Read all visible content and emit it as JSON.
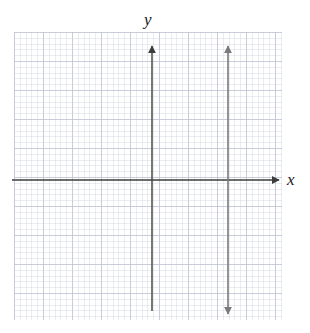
{
  "figure": {
    "width": 310,
    "height": 333,
    "background_color": "#ffffff"
  },
  "grid": {
    "name": "graph-paper-grid",
    "left": 14,
    "top": 32,
    "width": 268,
    "height": 288,
    "major_spacing_px": 29,
    "minor_spacing_px": 5.8,
    "major_color": "#7884a0",
    "minor_color": "#96a0b9",
    "visible": true
  },
  "axes": {
    "x_axis": {
      "label": "x",
      "name": "x-axis",
      "color": "#3c3c3c",
      "y_px": 180,
      "start_x_px": 12,
      "end_x_px": 284,
      "arrow": "right",
      "label_x_px": 287,
      "label_y_px": 171
    },
    "y_axis": {
      "label": "y",
      "name": "y-axis",
      "color": "#4a4a4a",
      "x_px": 152,
      "start_y_px": 41,
      "end_y_px": 311,
      "arrow": "up",
      "label_x_px": 144,
      "label_y_px": 11
    },
    "origin": {
      "x_px": 152,
      "y_px": 180
    }
  },
  "chart_data": {
    "type": "line",
    "title": "",
    "xlabel": "x",
    "ylabel": "y",
    "grid": true,
    "legend": "none",
    "xlim": [
      -4.8,
      4.6
    ],
    "ylim": [
      -4.8,
      5.1
    ],
    "series": [
      {
        "name": "vertical-line",
        "kind": "vertical-line",
        "equation": "x = 2.6",
        "x": 2.6,
        "color": "#7a7a7a",
        "arrows": "both",
        "x_px": 228,
        "top_y_px": 41,
        "bottom_y_px": 319
      }
    ],
    "annotations": []
  },
  "colors": {
    "background": "#ffffff",
    "axis": "#3c3c3c",
    "plotted_line": "#7a7a7a",
    "grid_major": "#7884a0",
    "grid_minor": "#96a0b9",
    "label_text": "#1a1a1a"
  }
}
